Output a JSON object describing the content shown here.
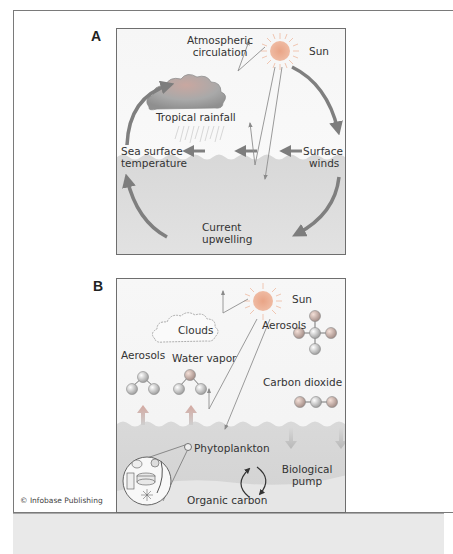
{
  "figure": {
    "credit": "© Infobase Publishing",
    "bottom_strip_text": "",
    "colors": {
      "frame_border": "#7a7a7a",
      "sky": "#f4f4f4",
      "ocean": "#d6d6d6",
      "arrow": "#7d7d7d",
      "sun": "#e6a98a",
      "sun_rays": "#f0c8b0",
      "strip": "#e9e9e9"
    }
  },
  "panel_a": {
    "letter": "A",
    "labels": {
      "atmospheric_circulation": "Atmospheric circulation",
      "atmospheric_line1": "Atmospheric",
      "atmospheric_line2": "circulation",
      "sun": "Sun",
      "tropical_rainfall": "Tropical rainfall",
      "sea_surface_line1": "Sea surface",
      "sea_surface_line2": "temperature",
      "surface_winds_line1": "Surface",
      "surface_winds_line2": "winds",
      "current_upwelling_line1": "Current",
      "current_upwelling_line2": "upwelling"
    }
  },
  "panel_b": {
    "letter": "B",
    "labels": {
      "sun": "Sun",
      "clouds": "Clouds",
      "water_vapor": "Water vapor",
      "aerosols_left": "Aerosols",
      "aerosols_right": "Aerosols",
      "carbon_dioxide": "Carbon dioxide",
      "phytoplankton": "Phytoplankton",
      "biological_line1": "Biological",
      "biological_line2": "pump",
      "organic_carbon": "Organic carbon"
    }
  }
}
